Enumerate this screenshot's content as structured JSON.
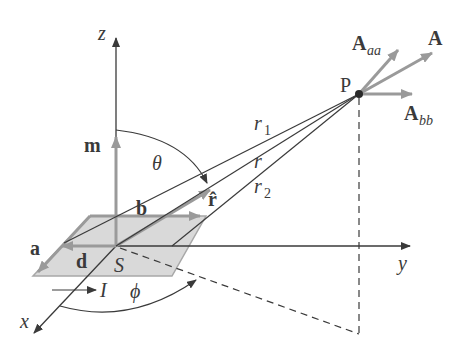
{
  "diagram": {
    "axes": {
      "z_label": "z",
      "y_label": "y",
      "x_label": "x"
    },
    "point": {
      "label": "P"
    },
    "vectors": {
      "m": "m",
      "a": "a",
      "b": "b",
      "d": "d",
      "r_hat": "r̂",
      "A": "A",
      "A_aa_main": "A",
      "A_aa_sub": "aa",
      "A_bb_main": "A",
      "A_bb_sub": "bb"
    },
    "distances": {
      "r1_main": "r",
      "r1_sub": "1",
      "r": "r",
      "r2_main": "r",
      "r2_sub": "2"
    },
    "angles": {
      "theta": "θ",
      "phi": "ϕ"
    },
    "loop": {
      "area_label": "S",
      "current_label": "I"
    },
    "colors": {
      "line": "#3a3a3a",
      "vector_gray": "#9a9a9a",
      "loop_fill": "#d9d9d9",
      "loop_edge": "#a8a8a8"
    }
  }
}
